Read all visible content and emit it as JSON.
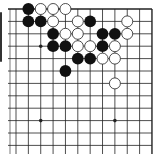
{
  "board": {
    "colors": {
      "background": "#ffffff",
      "line": "#222222",
      "black_stone": "#111111",
      "white_stone": "#ffffff",
      "white_stone_border": "#222222"
    },
    "grid": {
      "cols": 12,
      "rows": 12,
      "origin_x": 16,
      "origin_y": 9,
      "spacing_x": 12.36,
      "spacing_y": 12.4,
      "top_edge": true,
      "right_edge": true
    },
    "hoshi": [
      [
        2,
        3
      ],
      [
        2,
        9
      ],
      [
        8,
        9
      ]
    ],
    "stones": {
      "black": [
        [
          1,
          0
        ],
        [
          1,
          1
        ],
        [
          2,
          1
        ],
        [
          6,
          1
        ],
        [
          3,
          2
        ],
        [
          7,
          2
        ],
        [
          8,
          2
        ],
        [
          3,
          3
        ],
        [
          4,
          3
        ],
        [
          7,
          3
        ],
        [
          5,
          4
        ],
        [
          6,
          4
        ],
        [
          4,
          5
        ]
      ],
      "white": [
        [
          2,
          0
        ],
        [
          3,
          0
        ],
        [
          4,
          0
        ],
        [
          3,
          1
        ],
        [
          5,
          1
        ],
        [
          9,
          1
        ],
        [
          4,
          2
        ],
        [
          5,
          2
        ],
        [
          9,
          2
        ],
        [
          5,
          3
        ],
        [
          6,
          3
        ],
        [
          8,
          3
        ],
        [
          7,
          4
        ],
        [
          8,
          4
        ],
        [
          8,
          6
        ]
      ]
    }
  }
}
